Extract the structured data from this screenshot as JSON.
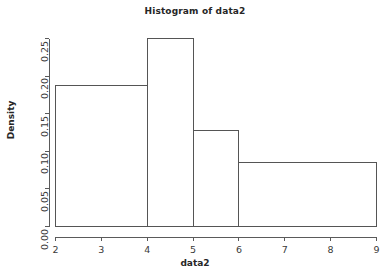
{
  "chart_data": {
    "type": "bar",
    "title": "Histogram of data2",
    "xlabel": "data2",
    "ylabel": "Density",
    "grid": false,
    "legend": null,
    "xlim": [
      2,
      9
    ],
    "ylim": [
      0.0,
      0.25
    ],
    "xticks": [
      "2",
      "3",
      "4",
      "5",
      "6",
      "7",
      "8",
      "9"
    ],
    "xtick_values": [
      2,
      3,
      4,
      5,
      6,
      7,
      8,
      9
    ],
    "yticks": [
      "0.00",
      "0.05",
      "0.10",
      "0.15",
      "0.20",
      "0.25"
    ],
    "ytick_values": [
      0.0,
      0.05,
      0.1,
      0.15,
      0.2,
      0.25
    ],
    "bins": [
      {
        "label": "2-4",
        "x0": 2,
        "x1": 4,
        "density": 0.188
      },
      {
        "label": "4-5",
        "x0": 4,
        "x1": 5,
        "density": 0.25
      },
      {
        "label": "5-6",
        "x0": 5,
        "x1": 6,
        "density": 0.127
      },
      {
        "label": "6-9",
        "x0": 6,
        "x1": 9,
        "density": 0.085
      }
    ],
    "categories": [
      "2-4",
      "4-5",
      "5-6",
      "6-9"
    ],
    "values": [
      0.188,
      0.25,
      0.127,
      0.085
    ],
    "colors": {
      "background": "#ffffff",
      "bar_stroke": "#555555",
      "bar_fill": "none",
      "axis": "#5a5a5a",
      "text": "#2b2b2b"
    }
  }
}
